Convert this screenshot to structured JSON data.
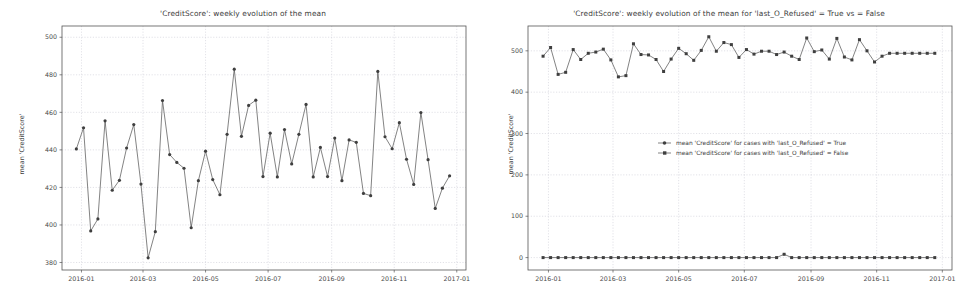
{
  "figures": [
    {
      "id": "left",
      "title": "'CreditScore': weekly evolution of the mean",
      "ylabel": "mean 'CreditScore'"
    },
    {
      "id": "right",
      "title": "'CreditScore': weekly evolution of the mean for 'last_O_Refused' = True vs = False",
      "ylabel": "mean 'CreditScore'"
    }
  ],
  "colors": {
    "line": "#4d4d4d",
    "marker": "#3f3f3f",
    "grid": "#cfcfd6",
    "axis": "#555555",
    "text": "#3b3b3b",
    "background": "#ffffff"
  },
  "chart_data": [
    {
      "type": "line",
      "title": "'CreditScore': weekly evolution of the mean",
      "xlabel": "",
      "ylabel": "mean 'CreditScore'",
      "grid": true,
      "legend": null,
      "xtick_labels": [
        "2016-01",
        "2016-03",
        "2016-05",
        "2016-07",
        "2016-09",
        "2016-11",
        "2017-01"
      ],
      "xtick_values": [
        "2016-01-01",
        "2016-03-01",
        "2016-05-01",
        "2016-07-01",
        "2016-09-01",
        "2016-11-01",
        "2017-01-01"
      ],
      "ytick_labels": [
        "380",
        "400",
        "420",
        "440",
        "460",
        "480",
        "500"
      ],
      "ylim": [
        376,
        506
      ],
      "xlim": [
        "2015-12-13",
        "2017-01-10"
      ],
      "marker": "circle",
      "series": [
        {
          "name": "mean 'CreditScore'",
          "x": [
            "2015-12-27",
            "2016-01-03",
            "2016-01-10",
            "2016-01-17",
            "2016-01-24",
            "2016-01-31",
            "2016-02-07",
            "2016-02-14",
            "2016-02-21",
            "2016-02-28",
            "2016-03-06",
            "2016-03-13",
            "2016-03-20",
            "2016-03-27",
            "2016-04-03",
            "2016-04-10",
            "2016-04-17",
            "2016-04-24",
            "2016-05-01",
            "2016-05-08",
            "2016-05-15",
            "2016-05-22",
            "2016-05-29",
            "2016-06-05",
            "2016-06-12",
            "2016-06-19",
            "2016-06-26",
            "2016-07-03",
            "2016-07-10",
            "2016-07-17",
            "2016-07-24",
            "2016-07-31",
            "2016-08-07",
            "2016-08-14",
            "2016-08-21",
            "2016-08-28",
            "2016-09-04",
            "2016-09-11",
            "2016-09-18",
            "2016-09-25",
            "2016-10-02",
            "2016-10-09",
            "2016-10-16",
            "2016-10-23",
            "2016-10-30",
            "2016-11-06",
            "2016-11-13",
            "2016-11-20",
            "2016-11-27",
            "2016-12-04",
            "2016-12-11",
            "2016-12-18",
            "2016-12-25"
          ],
          "values": [
            440.5,
            451.8,
            396.8,
            403.2,
            455.5,
            418.5,
            423.8,
            441.0,
            453.5,
            421.8,
            382.5,
            396.4,
            466.3,
            437.5,
            433.3,
            430.2,
            398.5,
            423.6,
            439.3,
            424.2,
            416.1,
            448.3,
            483.0,
            447.2,
            463.7,
            466.5,
            425.8,
            448.9,
            425.6,
            450.8,
            432.5,
            448.3,
            464.2,
            425.6,
            441.3,
            425.8,
            446.3,
            423.6,
            445.3,
            444.0,
            416.8,
            415.6,
            481.8,
            447.0,
            440.6,
            454.5,
            435.0,
            421.6,
            459.9,
            434.8,
            408.8,
            419.6,
            426.2
          ]
        }
      ]
    },
    {
      "type": "line",
      "title": "'CreditScore': weekly evolution of the mean for 'last_O_Refused' = True vs = False",
      "xlabel": "",
      "ylabel": "mean 'CreditScore'",
      "grid": true,
      "legend": {
        "position": "center-right",
        "entries": [
          "mean 'CreditScore' for cases with 'last_O_Refused' = True",
          "mean 'CreditScore' for cases with 'last_O_Refused' = False"
        ]
      },
      "xtick_labels": [
        "2016-01",
        "2016-03",
        "2016-05",
        "2016-07",
        "2016-09",
        "2016-11",
        "2017-01"
      ],
      "xtick_values": [
        "2016-01-01",
        "2016-03-01",
        "2016-05-01",
        "2016-07-01",
        "2016-09-01",
        "2016-11-01",
        "2017-01-01"
      ],
      "ytick_labels": [
        "0",
        "100",
        "200",
        "300",
        "400",
        "500"
      ],
      "ylim": [
        -30,
        560
      ],
      "xlim": [
        "2015-12-13",
        "2017-01-10"
      ],
      "marker": "square",
      "series": [
        {
          "name": "mean 'CreditScore' for cases with 'last_O_Refused' = True",
          "x": [
            "2015-12-27",
            "2016-01-03",
            "2016-01-10",
            "2016-01-17",
            "2016-01-24",
            "2016-01-31",
            "2016-02-07",
            "2016-02-14",
            "2016-02-21",
            "2016-02-28",
            "2016-03-06",
            "2016-03-13",
            "2016-03-20",
            "2016-03-27",
            "2016-04-03",
            "2016-04-10",
            "2016-04-17",
            "2016-04-24",
            "2016-05-01",
            "2016-05-08",
            "2016-05-15",
            "2016-05-22",
            "2016-05-29",
            "2016-06-05",
            "2016-06-12",
            "2016-06-19",
            "2016-06-26",
            "2016-07-03",
            "2016-07-10",
            "2016-07-17",
            "2016-07-24",
            "2016-07-31",
            "2016-08-07",
            "2016-08-14",
            "2016-08-21",
            "2016-08-28",
            "2016-09-04",
            "2016-09-11",
            "2016-09-18",
            "2016-09-25",
            "2016-10-02",
            "2016-10-09",
            "2016-10-16",
            "2016-10-23",
            "2016-10-30",
            "2016-11-06",
            "2016-11-13",
            "2016-11-20",
            "2016-11-27",
            "2016-12-04",
            "2016-12-11",
            "2016-12-18",
            "2016-12-25"
          ],
          "values": [
            0,
            0,
            0,
            0,
            0,
            0,
            0,
            0,
            0,
            0,
            0,
            0,
            0,
            0,
            0,
            0,
            0,
            0,
            0,
            0,
            0,
            0,
            0,
            0,
            0,
            0,
            0,
            0,
            0,
            0,
            0,
            0,
            8,
            0,
            0,
            0,
            0,
            0,
            0,
            0,
            0,
            0,
            0,
            0,
            0,
            0,
            0,
            0,
            0,
            0,
            0,
            0,
            0
          ]
        },
        {
          "name": "mean 'CreditScore' for cases with 'last_O_Refused' = False",
          "x": [
            "2015-12-27",
            "2016-01-03",
            "2016-01-10",
            "2016-01-17",
            "2016-01-24",
            "2016-01-31",
            "2016-02-07",
            "2016-02-14",
            "2016-02-21",
            "2016-02-28",
            "2016-03-06",
            "2016-03-13",
            "2016-03-20",
            "2016-03-27",
            "2016-04-03",
            "2016-04-10",
            "2016-04-17",
            "2016-04-24",
            "2016-05-01",
            "2016-05-08",
            "2016-05-15",
            "2016-05-22",
            "2016-05-29",
            "2016-06-05",
            "2016-06-12",
            "2016-06-19",
            "2016-06-26",
            "2016-07-03",
            "2016-07-10",
            "2016-07-17",
            "2016-07-24",
            "2016-07-31",
            "2016-08-07",
            "2016-08-14",
            "2016-08-21",
            "2016-08-28",
            "2016-09-04",
            "2016-09-11",
            "2016-09-18",
            "2016-09-25",
            "2016-10-02",
            "2016-10-09",
            "2016-10-16",
            "2016-10-23",
            "2016-10-30",
            "2016-11-06",
            "2016-11-13",
            "2016-11-20",
            "2016-11-27",
            "2016-12-04",
            "2016-12-11",
            "2016-12-18",
            "2016-12-25"
          ],
          "values": [
            487,
            508,
            443,
            448,
            503,
            479,
            494,
            497,
            504,
            478,
            437,
            440,
            517,
            491,
            490,
            479,
            450,
            480,
            506,
            493,
            477,
            501,
            534,
            499,
            520,
            515,
            484,
            503,
            492,
            499,
            499,
            491,
            497,
            487,
            479,
            531,
            498,
            502,
            480,
            530,
            485,
            478,
            527,
            500,
            473,
            487,
            494,
            494,
            494,
            494,
            494,
            494,
            494
          ]
        }
      ]
    }
  ]
}
